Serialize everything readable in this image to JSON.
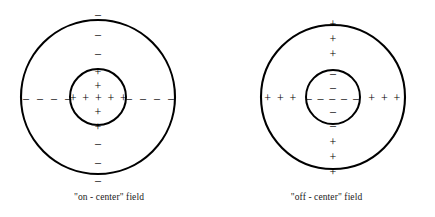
{
  "figure": {
    "type": "diagram",
    "stroke_color": "#000000",
    "background_color": "#ffffff",
    "dash_color": "#333333"
  },
  "panels": [
    {
      "id": "on-center",
      "caption": "\"on - center\" field",
      "center": {
        "x": 98,
        "y": 97
      },
      "outer_radius": 77,
      "inner_radius": 28,
      "center_region": {
        "sign": "+",
        "vertical_above": [
          "+",
          "+"
        ],
        "vertical_below": [
          "+",
          "+"
        ],
        "horizontal_row": "+ + + + +"
      },
      "surround_region": {
        "sign": "-",
        "above": [
          "–",
          "–",
          "–"
        ],
        "below": [
          "–",
          "–",
          "–"
        ],
        "left_dashes": [
          "–",
          "–",
          "–",
          "–"
        ],
        "right_dashes": [
          "–",
          "–",
          "–",
          "–"
        ]
      }
    },
    {
      "id": "off-center",
      "caption": "\"off - center\" field",
      "center": {
        "x": 115,
        "y": 97
      },
      "outer_radius": 72,
      "inner_radius": 27,
      "center_region": {
        "sign": "-",
        "vertical_above": [
          "–",
          "–"
        ],
        "vertical_below": [
          "–",
          "–"
        ],
        "horizontal_row": "– – – – –"
      },
      "surround_region": {
        "sign": "+",
        "above": [
          "+",
          "+",
          "+"
        ],
        "below": [
          "+",
          "+",
          "+"
        ],
        "left_row": "+ + +",
        "right_row": "+ + +"
      }
    }
  ]
}
